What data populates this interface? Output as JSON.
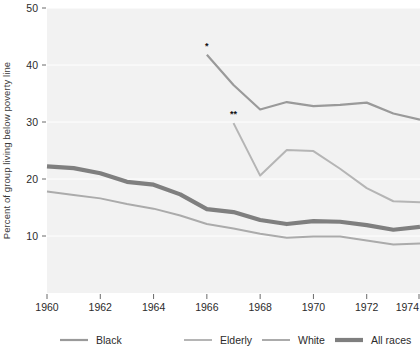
{
  "chart_data": {
    "type": "line",
    "title": "",
    "xlabel": "",
    "ylabel": "Percent of group living below poverty line",
    "xlim": [
      1960,
      1974
    ],
    "ylim": [
      0,
      50
    ],
    "xticks": [
      1960,
      1962,
      1964,
      1966,
      1968,
      1970,
      1972,
      1974
    ],
    "yticks": [
      10,
      20,
      30,
      40,
      50
    ],
    "grid": true,
    "legend_position": "bottom",
    "plot_background": "#f2f2f2",
    "series": [
      {
        "name": "Black",
        "color": "#9a9a9a",
        "width": 2.2,
        "annotation": "*",
        "x": [
          1966,
          1967,
          1968,
          1969,
          1970,
          1971,
          1972,
          1973,
          1974
        ],
        "values": [
          41.8,
          36.5,
          32.2,
          33.5,
          32.8,
          33.0,
          33.4,
          31.5,
          30.4
        ]
      },
      {
        "name": "Elderly",
        "color": "#b5b5b5",
        "width": 2.0,
        "annotation": "**",
        "x": [
          1967,
          1968,
          1969,
          1970,
          1971,
          1972,
          1973,
          1974
        ],
        "values": [
          29.8,
          20.6,
          25.1,
          24.9,
          21.8,
          18.4,
          16.1,
          15.9
        ]
      },
      {
        "name": "White",
        "color": "#ababab",
        "width": 2.0,
        "annotation": "",
        "x": [
          1960,
          1961,
          1962,
          1963,
          1964,
          1965,
          1966,
          1967,
          1968,
          1969,
          1970,
          1971,
          1972,
          1973,
          1974
        ],
        "values": [
          17.8,
          17.2,
          16.6,
          15.6,
          14.8,
          13.6,
          12.1,
          11.3,
          10.4,
          9.7,
          9.9,
          9.9,
          9.2,
          8.5,
          8.7
        ]
      },
      {
        "name": "All races",
        "color": "#7f7f7f",
        "width": 4.2,
        "annotation": "",
        "x": [
          1960,
          1961,
          1962,
          1963,
          1964,
          1965,
          1966,
          1967,
          1968,
          1969,
          1970,
          1971,
          1972,
          1973,
          1974
        ],
        "values": [
          22.2,
          21.9,
          21.0,
          19.5,
          19.0,
          17.3,
          14.7,
          14.2,
          12.8,
          12.1,
          12.6,
          12.5,
          11.9,
          11.1,
          11.6
        ]
      }
    ],
    "legend": [
      {
        "label": "Black",
        "color": "#9a9a9a",
        "width": 2.2
      },
      {
        "label": "Elderly",
        "color": "#b5b5b5",
        "width": 2.0
      },
      {
        "label": "White",
        "color": "#ababab",
        "width": 2.0
      },
      {
        "label": "All races",
        "color": "#7f7f7f",
        "width": 4.2
      }
    ]
  }
}
